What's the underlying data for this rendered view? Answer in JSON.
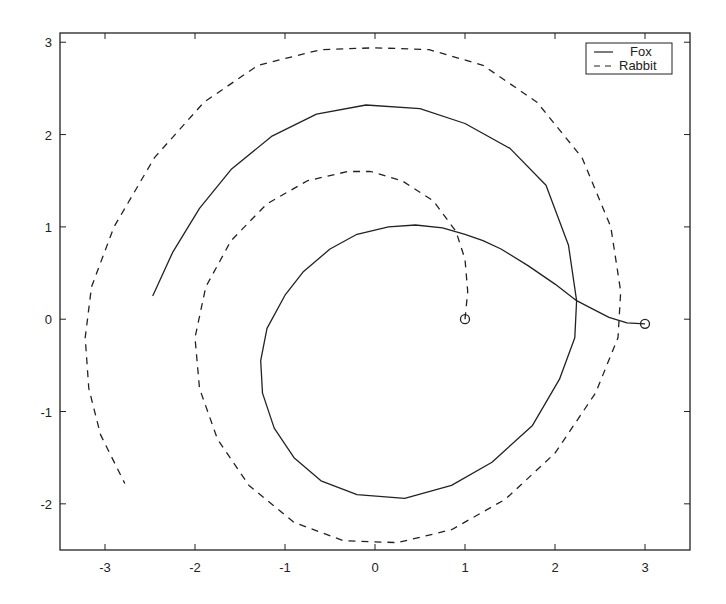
{
  "chart_data": {
    "type": "line",
    "title": "",
    "xlabel": "",
    "ylabel": "",
    "xlim": [
      -3.5,
      3.5
    ],
    "ylim": [
      -2.5,
      3.1
    ],
    "xticks": [
      -3,
      -2,
      -1,
      0,
      1,
      2,
      3
    ],
    "yticks": [
      -2,
      -1,
      0,
      1,
      2,
      3
    ],
    "xtick_labels": [
      "-3",
      "-2",
      "-1",
      "0",
      "1",
      "2",
      "3"
    ],
    "ytick_labels": [
      "-2",
      "-1",
      "0",
      "1",
      "2",
      "3"
    ],
    "grid": false,
    "legend_position": "upper right",
    "series": [
      {
        "name": "Fox",
        "style": "solid",
        "color": "#222222",
        "start_marker": "circle",
        "points": [
          [
            3.0,
            -0.05
          ],
          [
            2.8,
            -0.04
          ],
          [
            2.6,
            0.02
          ],
          [
            2.4,
            0.12
          ],
          [
            2.24,
            0.2
          ],
          [
            2.0,
            0.38
          ],
          [
            1.7,
            0.58
          ],
          [
            1.4,
            0.76
          ],
          [
            1.2,
            0.85
          ],
          [
            1.0,
            0.92
          ],
          [
            0.75,
            0.99
          ],
          [
            0.45,
            1.02
          ],
          [
            0.15,
            1.0
          ],
          [
            -0.2,
            0.92
          ],
          [
            -0.5,
            0.76
          ],
          [
            -0.8,
            0.51
          ],
          [
            -1.0,
            0.26
          ],
          [
            -1.2,
            -0.1
          ],
          [
            -1.27,
            -0.45
          ],
          [
            -1.25,
            -0.8
          ],
          [
            -1.12,
            -1.18
          ],
          [
            -0.9,
            -1.5
          ],
          [
            -0.6,
            -1.75
          ],
          [
            -0.2,
            -1.9
          ],
          [
            0.33,
            -1.94
          ],
          [
            0.85,
            -1.8
          ],
          [
            1.3,
            -1.55
          ],
          [
            1.75,
            -1.15
          ],
          [
            2.05,
            -0.65
          ],
          [
            2.22,
            -0.2
          ],
          [
            2.24,
            0.2
          ],
          [
            2.15,
            0.8
          ],
          [
            1.9,
            1.45
          ],
          [
            1.5,
            1.85
          ],
          [
            1.0,
            2.12
          ],
          [
            0.5,
            2.28
          ],
          [
            -0.1,
            2.32
          ],
          [
            -0.65,
            2.22
          ],
          [
            -1.15,
            1.98
          ],
          [
            -1.6,
            1.62
          ],
          [
            -1.95,
            1.2
          ],
          [
            -2.25,
            0.72
          ],
          [
            -2.47,
            0.25
          ]
        ]
      },
      {
        "name": "Rabbit",
        "style": "dashed",
        "color": "#222222",
        "start_marker": "circle",
        "points": [
          [
            1.0,
            0.0
          ],
          [
            1.03,
            0.3
          ],
          [
            1.0,
            0.65
          ],
          [
            0.9,
            0.95
          ],
          [
            0.65,
            1.28
          ],
          [
            0.3,
            1.5
          ],
          [
            -0.05,
            1.6
          ],
          [
            -0.3,
            1.6
          ],
          [
            -0.75,
            1.5
          ],
          [
            -1.2,
            1.25
          ],
          [
            -1.6,
            0.85
          ],
          [
            -1.88,
            0.35
          ],
          [
            -2.0,
            -0.2
          ],
          [
            -1.95,
            -0.75
          ],
          [
            -1.75,
            -1.3
          ],
          [
            -1.4,
            -1.8
          ],
          [
            -0.9,
            -2.2
          ],
          [
            -0.35,
            -2.4
          ],
          [
            0.25,
            -2.42
          ],
          [
            0.85,
            -2.28
          ],
          [
            1.45,
            -1.95
          ],
          [
            2.0,
            -1.45
          ],
          [
            2.45,
            -0.8
          ],
          [
            2.7,
            -0.2
          ],
          [
            2.73,
            0.3
          ],
          [
            2.62,
            1.0
          ],
          [
            2.3,
            1.75
          ],
          [
            1.8,
            2.35
          ],
          [
            1.2,
            2.75
          ],
          [
            0.6,
            2.92
          ],
          [
            0.0,
            2.94
          ],
          [
            -0.6,
            2.92
          ],
          [
            -1.3,
            2.75
          ],
          [
            -1.9,
            2.35
          ],
          [
            -2.45,
            1.75
          ],
          [
            -2.9,
            1.0
          ],
          [
            -3.15,
            0.35
          ],
          [
            -3.22,
            -0.2
          ],
          [
            -3.18,
            -0.75
          ],
          [
            -3.05,
            -1.25
          ],
          [
            -2.78,
            -1.78
          ]
        ]
      }
    ]
  },
  "legend": {
    "items": [
      {
        "label": "Fox",
        "style": "solid"
      },
      {
        "label": "Rabbit",
        "style": "dashed"
      }
    ]
  },
  "layout": {
    "axes_px": {
      "left": 60,
      "top": 33,
      "right": 690,
      "bottom": 550
    },
    "line_color": "#222222",
    "background": "#ffffff"
  }
}
